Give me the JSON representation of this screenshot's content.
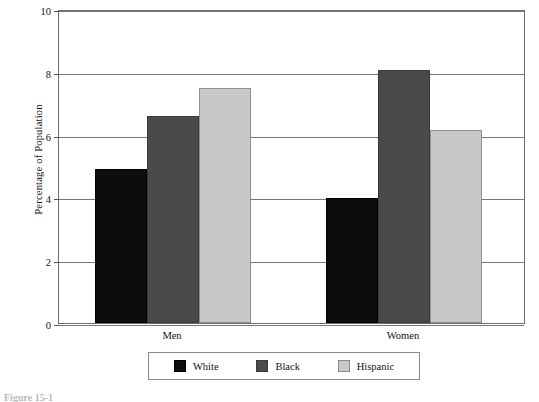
{
  "chart_data": {
    "type": "bar",
    "title": "",
    "subtitle": "",
    "xlabel": "",
    "ylabel": "Percentage of Population",
    "categories": [
      "Men",
      "Women"
    ],
    "series": [
      {
        "name": "White",
        "color": "#0d0d0d",
        "values": [
          4.9,
          3.97
        ]
      },
      {
        "name": "Black",
        "color": "#4a4a4a",
        "values": [
          6.6,
          8.05
        ]
      },
      {
        "name": "Hispanic",
        "color": "#c8c8c8",
        "values": [
          7.5,
          6.15
        ]
      }
    ],
    "ylim": [
      0,
      10
    ],
    "yticks": [
      0,
      2,
      4,
      6,
      8,
      10
    ],
    "ytick_labels": [
      "0",
      "2",
      "4",
      "6",
      "8",
      "10"
    ],
    "grid": true,
    "grid_axis": "y",
    "legend_position": "bottom"
  },
  "legend": {
    "entries": [
      {
        "label": "White"
      },
      {
        "label": "Black"
      },
      {
        "label": "Hispanic"
      }
    ]
  },
  "caption": {
    "text": "Figure 15-1"
  }
}
